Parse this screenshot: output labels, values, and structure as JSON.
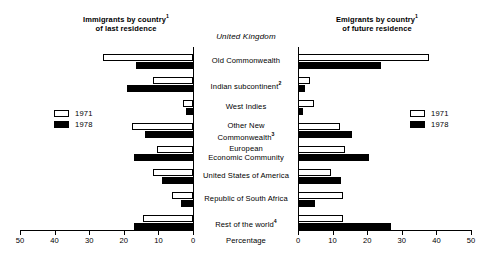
{
  "headers": {
    "left_title_line1": "Immigrants by country",
    "left_title_sup": "1",
    "left_title_line2": "of last residence",
    "right_title_line1": "Emigrants by country",
    "right_title_sup": "1",
    "right_title_line2": "of future residence",
    "country": "United Kingdom"
  },
  "legend": {
    "left": [
      {
        "label": "1971",
        "key": "y1971"
      },
      {
        "label": "1978",
        "key": "y1978"
      }
    ],
    "right": [
      {
        "label": "1971",
        "key": "y1971"
      },
      {
        "label": "1978",
        "key": "y1978"
      }
    ]
  },
  "axis": {
    "unit_label": "Percentage",
    "left_ticks": [
      "50",
      "40",
      "30",
      "20",
      "10",
      "0"
    ],
    "right_ticks": [
      "0",
      "10",
      "20",
      "30",
      "40",
      "50"
    ],
    "max": 50
  },
  "categories": [
    {
      "label": "Old Commonwealth",
      "sup": ""
    },
    {
      "label": "Indian subcontinent",
      "sup": "2"
    },
    {
      "label": "West Indies",
      "sup": ""
    },
    {
      "label": "Other New\nCommonwealth",
      "sup": "3"
    },
    {
      "label": "European\nEconomic Community",
      "sup": ""
    },
    {
      "label": "United States of America",
      "sup": ""
    },
    {
      "label": "Republic of South Africa",
      "sup": ""
    },
    {
      "label": "Rest of the world",
      "sup": "4"
    }
  ],
  "chart_data": {
    "type": "bar",
    "orientation": "horizontal-butterfly",
    "title": "United Kingdom",
    "xlabel": "Percentage",
    "ylabel": "",
    "xlim": [
      0,
      50
    ],
    "grid": false,
    "legend_position": "inner-left-and-right",
    "categories": [
      "Old Commonwealth",
      "Indian subcontinent",
      "West Indies",
      "Other New Commonwealth",
      "European Economic Community",
      "United States of America",
      "Republic of South Africa",
      "Rest of the world"
    ],
    "panels": [
      {
        "name": "Immigrants by country of last residence",
        "direction": "left",
        "series": [
          {
            "name": "1971",
            "values": [
              26.0,
              11.5,
              3.0,
              17.5,
              10.5,
              11.5,
              6.0,
              14.5
            ]
          },
          {
            "name": "1978",
            "values": [
              16.5,
              19.0,
              2.0,
              14.0,
              17.0,
              9.0,
              3.5,
              17.0
            ]
          }
        ]
      },
      {
        "name": "Emigrants by country of future residence",
        "direction": "right",
        "series": [
          {
            "name": "1971",
            "values": [
              38.0,
              3.5,
              4.5,
              12.0,
              13.5,
              9.5,
              13.0,
              13.0
            ]
          },
          {
            "name": "1978",
            "values": [
              24.0,
              2.0,
              1.5,
              15.5,
              20.5,
              12.5,
              5.0,
              27.0
            ]
          }
        ]
      }
    ]
  }
}
